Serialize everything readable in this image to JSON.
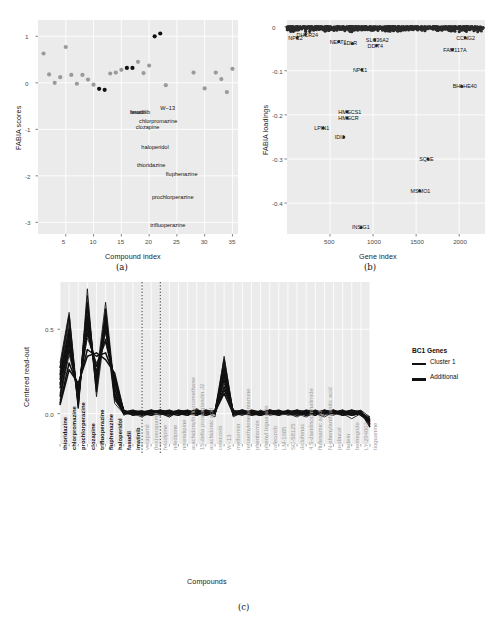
{
  "figure": {
    "captions": {
      "a": "(a)",
      "b": "(b)",
      "c": "(c)"
    }
  },
  "panel_a": {
    "caption": "(a)",
    "chart_data": {
      "type": "scatter",
      "title": "",
      "xlabel": "Compound index",
      "ylabel": "FABIA scores",
      "xlim": [
        0,
        36
      ],
      "ylim": [
        -3.25,
        1.35
      ],
      "xticks": [
        5,
        10,
        15,
        20,
        25,
        30,
        35
      ],
      "yticks": [
        1,
        0,
        -1,
        -2,
        -3
      ],
      "grid": true,
      "legend": "none",
      "series": [
        {
          "name": "Cluster 1 (highlighted, black)",
          "color": "#111111",
          "points": [
            {
              "x": 11,
              "y": -0.13
            },
            {
              "x": 12,
              "y": -0.15
            },
            {
              "x": 16,
              "y": 0.32
            },
            {
              "x": 17,
              "y": 0.32
            },
            {
              "x": 21,
              "y": 1.0
            },
            {
              "x": 22,
              "y": 1.06
            }
          ]
        },
        {
          "name": "Other compounds (grey)",
          "color": "#9a9a9a",
          "points": [
            {
              "x": 1,
              "y": 0.63
            },
            {
              "x": 2,
              "y": 0.18
            },
            {
              "x": 3,
              "y": 0.0
            },
            {
              "x": 4,
              "y": 0.12
            },
            {
              "x": 5,
              "y": 0.77
            },
            {
              "x": 6,
              "y": 0.17
            },
            {
              "x": 7,
              "y": -0.02
            },
            {
              "x": 8,
              "y": 0.17
            },
            {
              "x": 9,
              "y": 0.07
            },
            {
              "x": 10,
              "y": -0.04
            },
            {
              "x": 13,
              "y": 0.2
            },
            {
              "x": 14,
              "y": 0.22
            },
            {
              "x": 15,
              "y": 0.28
            },
            {
              "x": 18,
              "y": 0.45
            },
            {
              "x": 19,
              "y": 0.21
            },
            {
              "x": 20,
              "y": 0.37
            },
            {
              "x": 23,
              "y": -0.05
            },
            {
              "x": 28,
              "y": 0.22
            },
            {
              "x": 30,
              "y": -0.12
            },
            {
              "x": 32,
              "y": 0.22
            },
            {
              "x": 33,
              "y": 0.08
            },
            {
              "x": 34,
              "y": -0.2
            },
            {
              "x": 35,
              "y": 0.3
            }
          ]
        }
      ],
      "point_labels": [
        {
          "text": "fasudil",
          "x": 16.5,
          "y": -0.62
        },
        {
          "text": "imatinib",
          "x": 16.7,
          "y": -0.62
        },
        {
          "text": "W−13",
          "x": 22.0,
          "y": -0.55
        },
        {
          "text": "chlorpromazine",
          "x": 18.2,
          "y": -0.82
        },
        {
          "text": "clozapine",
          "x": 17.6,
          "y": -0.95
        },
        {
          "text": "haloperidol",
          "x": 18.6,
          "y": -1.38
        },
        {
          "text": "thioridazine",
          "x": 17.8,
          "y": -1.77
        },
        {
          "text": "fluphenazine",
          "x": 23.0,
          "y": -1.95
        },
        {
          "text": "prochlorperazine",
          "x": 20.5,
          "y": -2.45
        },
        {
          "text": "trifluoperazine",
          "x": 20.2,
          "y": -3.05
        }
      ]
    }
  },
  "panel_b": {
    "caption": "(b)",
    "chart_data": {
      "type": "scatter",
      "title": "",
      "xlabel": "Gene index",
      "ylabel": "FABIA loadings",
      "xlim": [
        0,
        2300
      ],
      "ylim": [
        -0.47,
        0.015
      ],
      "xticks": [
        500,
        1000,
        1500,
        2000
      ],
      "yticks": [
        0,
        -0.1,
        -0.2,
        -0.3,
        -0.4
      ],
      "grid": true,
      "legend": "none",
      "note": "Dense band of near-zero loadings across all genes; labelled outliers listed below.",
      "gene_labels": [
        {
          "gene": "NPC2",
          "x": 120,
          "y": -0.025
        },
        {
          "gene": "DHCR24",
          "x": 215,
          "y": -0.018
        },
        {
          "gene": "NEAT1",
          "x": 600,
          "y": -0.034
        },
        {
          "gene": "LDLR",
          "x": 760,
          "y": -0.038
        },
        {
          "gene": "SLC36A2",
          "x": 1020,
          "y": -0.03
        },
        {
          "gene": "DDIT4",
          "x": 1040,
          "y": -0.043
        },
        {
          "gene": "CCNG2",
          "x": 2070,
          "y": -0.025
        },
        {
          "gene": "FAM117A",
          "x": 1920,
          "y": -0.052
        },
        {
          "gene": "NPC1",
          "x": 870,
          "y": -0.098
        },
        {
          "gene": "BHLHE40",
          "x": 2030,
          "y": -0.135
        },
        {
          "gene": "HMGCS1",
          "x": 700,
          "y": -0.193
        },
        {
          "gene": "HMGCR",
          "x": 700,
          "y": -0.207
        },
        {
          "gene": "LPIN1",
          "x": 420,
          "y": -0.23
        },
        {
          "gene": "IDI1",
          "x": 660,
          "y": -0.25
        },
        {
          "gene": "SQLE",
          "x": 1640,
          "y": -0.3
        },
        {
          "gene": "MSMO1",
          "x": 1540,
          "y": -0.372
        },
        {
          "gene": "INSIG1",
          "x": 860,
          "y": -0.455
        }
      ]
    }
  },
  "panel_c": {
    "caption": "(c)",
    "chart_data": {
      "type": "line",
      "title": "",
      "xlabel": "Compounds",
      "ylabel": "Centered read-out",
      "yticks": [
        0.0,
        0.5
      ],
      "ylim": [
        -0.18,
        0.78
      ],
      "grid": true,
      "divider_positions": [
        9,
        11
      ],
      "categories": [
        "thioridazine",
        "chlorpromazine",
        "prochlorperazine",
        "clozapine",
        "trifluoperazine",
        "fluphenazine",
        "haloperidol",
        "fasudil",
        "imatinib",
        "verapamil",
        "(lex)verapamil",
        "felodipine",
        "nifedipine",
        "nitrendipine",
        "arachidonyltrifluoromethane",
        "15-delta prostaglandin J2",
        "arachidonic acid",
        "celecoxib",
        "W−13",
        "metformin",
        "tetraethylenepentamine",
        "phentermin",
        "phenyl biguanide",
        "rofecoxib",
        "LM-1685",
        "SC-58125",
        "diclofenac",
        "4,5-dianilinophthalimide",
        "flufenamic acid",
        "N-phenylanthranilic acid",
        "probucol",
        "butein",
        "bemegride",
        "LY-294002",
        "tioguanine"
      ],
      "category_groups": [
        "cluster1",
        "cluster1",
        "cluster1",
        "cluster1",
        "cluster1",
        "cluster1",
        "cluster1",
        "cluster1",
        "cluster1",
        "additional",
        "additional",
        "additional",
        "additional",
        "additional",
        "additional",
        "additional",
        "additional",
        "additional",
        "additional",
        "additional",
        "additional",
        "additional",
        "additional",
        "additional",
        "additional",
        "additional",
        "additional",
        "additional",
        "additional",
        "additional",
        "additional",
        "additional",
        "additional",
        "additional",
        "additional"
      ],
      "legend": {
        "title": "BC1 Genes",
        "position": "right",
        "entries": [
          {
            "label": "Cluster 1",
            "color": "#111111",
            "linewidth": "thin"
          },
          {
            "label": "Additional",
            "color": "#111111",
            "linewidth": "thick"
          }
        ]
      },
      "series": [
        {
          "name": "gene-1",
          "group": "Cluster 1",
          "values": [
            0.22,
            0.52,
            0.07,
            0.62,
            0.18,
            0.6,
            0.1,
            0.02,
            0.0,
            -0.01,
            0.02,
            0.0,
            -0.02,
            0.01,
            0.0,
            0.03,
            -0.01,
            0.0,
            0.3,
            -0.02,
            0.01,
            0.0,
            -0.01,
            0.0,
            0.02,
            0.0,
            -0.02,
            0.01,
            0.0,
            -0.01,
            0.02,
            0.0,
            -0.03,
            0.0,
            -0.02
          ]
        },
        {
          "name": "gene-2",
          "group": "Cluster 1",
          "values": [
            0.18,
            0.46,
            0.09,
            0.56,
            0.22,
            0.66,
            0.14,
            0.0,
            0.01,
            0.01,
            -0.01,
            0.02,
            0.0,
            -0.01,
            0.02,
            0.0,
            0.01,
            -0.02,
            0.34,
            0.0,
            -0.01,
            0.02,
            0.0,
            0.01,
            -0.01,
            0.02,
            0.0,
            -0.02,
            0.01,
            0.0,
            0.01,
            -0.01,
            0.0,
            0.02,
            -0.04
          ]
        },
        {
          "name": "gene-3",
          "group": "Cluster 1",
          "values": [
            0.25,
            0.55,
            0.05,
            0.7,
            0.15,
            0.55,
            0.08,
            0.01,
            -0.01,
            0.0,
            0.01,
            -0.01,
            0.02,
            0.0,
            -0.01,
            0.01,
            0.0,
            0.02,
            0.26,
            0.01,
            0.0,
            -0.01,
            0.02,
            -0.01,
            0.0,
            0.01,
            0.02,
            0.0,
            -0.01,
            0.01,
            0.0,
            0.02,
            -0.01,
            0.0,
            -0.05
          ]
        },
        {
          "name": "gene-4",
          "group": "Cluster 1",
          "values": [
            0.12,
            0.4,
            0.12,
            0.5,
            0.25,
            0.48,
            0.16,
            -0.01,
            0.02,
            0.01,
            0.0,
            0.01,
            -0.02,
            0.02,
            0.01,
            -0.01,
            0.02,
            0.0,
            0.22,
            -0.01,
            0.02,
            0.0,
            0.01,
            0.02,
            -0.01,
            0.0,
            0.01,
            0.02,
            0.0,
            -0.02,
            0.01,
            0.0,
            0.02,
            -0.01,
            -0.03
          ]
        },
        {
          "name": "gene-5",
          "group": "Cluster 1",
          "values": [
            0.08,
            0.35,
            0.14,
            0.45,
            0.3,
            0.42,
            0.2,
            0.02,
            0.0,
            -0.02,
            0.01,
            0.02,
            0.0,
            0.01,
            -0.01,
            0.02,
            0.0,
            0.01,
            0.18,
            0.02,
            -0.01,
            0.01,
            0.0,
            0.02,
            0.01,
            -0.01,
            0.0,
            0.01,
            0.02,
            0.0,
            -0.01,
            0.02,
            0.0,
            0.01,
            -0.06
          ]
        },
        {
          "name": "gene-6",
          "group": "Cluster 1",
          "values": [
            0.3,
            0.6,
            0.03,
            0.74,
            0.1,
            0.52,
            0.06,
            0.0,
            0.01,
            0.02,
            -0.01,
            0.0,
            0.01,
            0.02,
            0.0,
            -0.01,
            0.01,
            0.02,
            0.28,
            0.0,
            0.01,
            -0.01,
            0.02,
            0.0,
            0.01,
            0.02,
            -0.01,
            0.0,
            0.01,
            0.02,
            0.0,
            -0.01,
            0.01,
            0.02,
            -0.02
          ]
        },
        {
          "name": "gene-7",
          "group": "Additional",
          "values": [
            0.06,
            0.3,
            0.16,
            0.38,
            0.34,
            0.36,
            0.22,
            0.01,
            0.0,
            0.01,
            0.02,
            0.0,
            -0.01,
            0.01,
            0.02,
            0.0,
            -0.01,
            0.01,
            0.14,
            0.02,
            0.0,
            0.01,
            -0.01,
            0.02,
            0.0,
            0.01,
            0.02,
            -0.01,
            0.0,
            0.01,
            0.02,
            0.0,
            -0.01,
            0.01,
            -0.07
          ]
        },
        {
          "name": "gene-8",
          "group": "Additional",
          "values": [
            0.2,
            0.48,
            0.08,
            0.58,
            0.2,
            0.58,
            0.12,
            0.0,
            0.01,
            -0.01,
            0.0,
            0.02,
            0.01,
            0.0,
            -0.01,
            0.02,
            0.01,
            0.0,
            0.24,
            0.01,
            0.02,
            0.0,
            -0.01,
            0.01,
            0.02,
            0.0,
            0.01,
            -0.01,
            0.02,
            0.0,
            0.01,
            0.02,
            -0.01,
            0.0,
            -0.04
          ]
        },
        {
          "name": "gene-9",
          "group": "Additional",
          "values": [
            0.15,
            0.42,
            0.11,
            0.52,
            0.24,
            0.5,
            0.18,
            0.02,
            -0.01,
            0.0,
            0.01,
            0.02,
            0.0,
            -0.01,
            0.01,
            0.02,
            0.0,
            0.01,
            0.2,
            -0.01,
            0.0,
            0.02,
            0.01,
            0.0,
            -0.01,
            0.02,
            0.0,
            0.01,
            -0.01,
            0.02,
            0.0,
            0.01,
            0.02,
            -0.01,
            -0.05
          ]
        },
        {
          "name": "gene-10",
          "group": "Additional",
          "values": [
            0.1,
            0.38,
            0.13,
            0.48,
            0.28,
            0.44,
            0.19,
            0.01,
            0.02,
            0.0,
            -0.01,
            0.01,
            0.02,
            0.0,
            0.01,
            -0.01,
            0.02,
            0.0,
            0.16,
            0.01,
            0.02,
            -0.01,
            0.0,
            0.02,
            0.01,
            0.0,
            -0.01,
            0.02,
            0.01,
            0.0,
            0.02,
            -0.01,
            0.0,
            0.01,
            -0.06
          ]
        },
        {
          "name": "gene-11",
          "group": "Additional",
          "values": [
            0.27,
            0.58,
            0.04,
            0.66,
            0.13,
            0.62,
            0.09,
            0.0,
            0.0,
            0.01,
            0.01,
            0.0,
            0.0,
            0.01,
            0.0,
            0.01,
            0.0,
            0.01,
            0.32,
            0.0,
            0.01,
            0.0,
            0.01,
            0.0,
            0.01,
            0.0,
            0.01,
            0.0,
            0.01,
            0.0,
            0.01,
            0.0,
            0.01,
            0.0,
            -0.03
          ]
        },
        {
          "name": "gene-12",
          "group": "Additional",
          "values": [
            0.05,
            0.26,
            0.18,
            0.34,
            0.36,
            0.32,
            0.24,
            0.01,
            0.01,
            0.0,
            0.02,
            0.01,
            0.0,
            0.02,
            0.01,
            0.0,
            0.02,
            0.01,
            0.12,
            0.0,
            0.02,
            0.01,
            0.0,
            0.02,
            0.01,
            0.0,
            0.02,
            0.01,
            0.0,
            0.02,
            0.01,
            0.0,
            0.02,
            0.01,
            -0.08
          ]
        },
        {
          "name": "gene-13",
          "group": "Additional",
          "values": [
            0.23,
            0.5,
            0.06,
            0.64,
            0.16,
            0.56,
            0.11,
            0.0,
            0.01,
            0.01,
            0.0,
            0.01,
            0.01,
            0.0,
            0.01,
            0.01,
            0.0,
            0.01,
            0.27,
            0.01,
            0.0,
            0.01,
            0.01,
            0.0,
            0.01,
            0.01,
            0.0,
            0.01,
            0.01,
            0.0,
            0.01,
            0.01,
            0.0,
            0.01,
            -0.04
          ]
        },
        {
          "name": "gene-14",
          "group": "Additional",
          "values": [
            0.17,
            0.44,
            0.1,
            0.54,
            0.21,
            0.54,
            0.15,
            0.01,
            0.0,
            0.0,
            0.01,
            0.0,
            0.01,
            0.01,
            0.0,
            0.01,
            0.01,
            0.0,
            0.23,
            0.0,
            0.01,
            0.01,
            0.0,
            0.01,
            0.0,
            0.01,
            0.01,
            0.0,
            0.01,
            0.01,
            0.0,
            0.01,
            0.01,
            0.0,
            -0.05
          ]
        }
      ]
    }
  }
}
